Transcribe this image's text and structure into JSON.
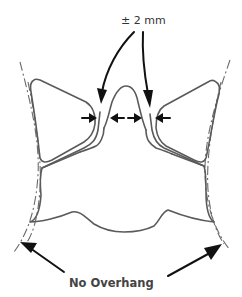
{
  "diagram": {
    "tolerance_label": "± 2 mm",
    "overhang_label": "No Overhang",
    "colors": {
      "outline": "#5a5a5a",
      "arrow": "#111111",
      "text": "#333333",
      "background": "#ffffff"
    },
    "parts": [
      {
        "name": "left-wing-shape"
      },
      {
        "name": "right-wing-shape"
      },
      {
        "name": "center-keystone-shape"
      },
      {
        "name": "bottom-base-shape"
      },
      {
        "name": "left-dashed-boundary"
      },
      {
        "name": "right-dashed-boundary"
      }
    ]
  }
}
